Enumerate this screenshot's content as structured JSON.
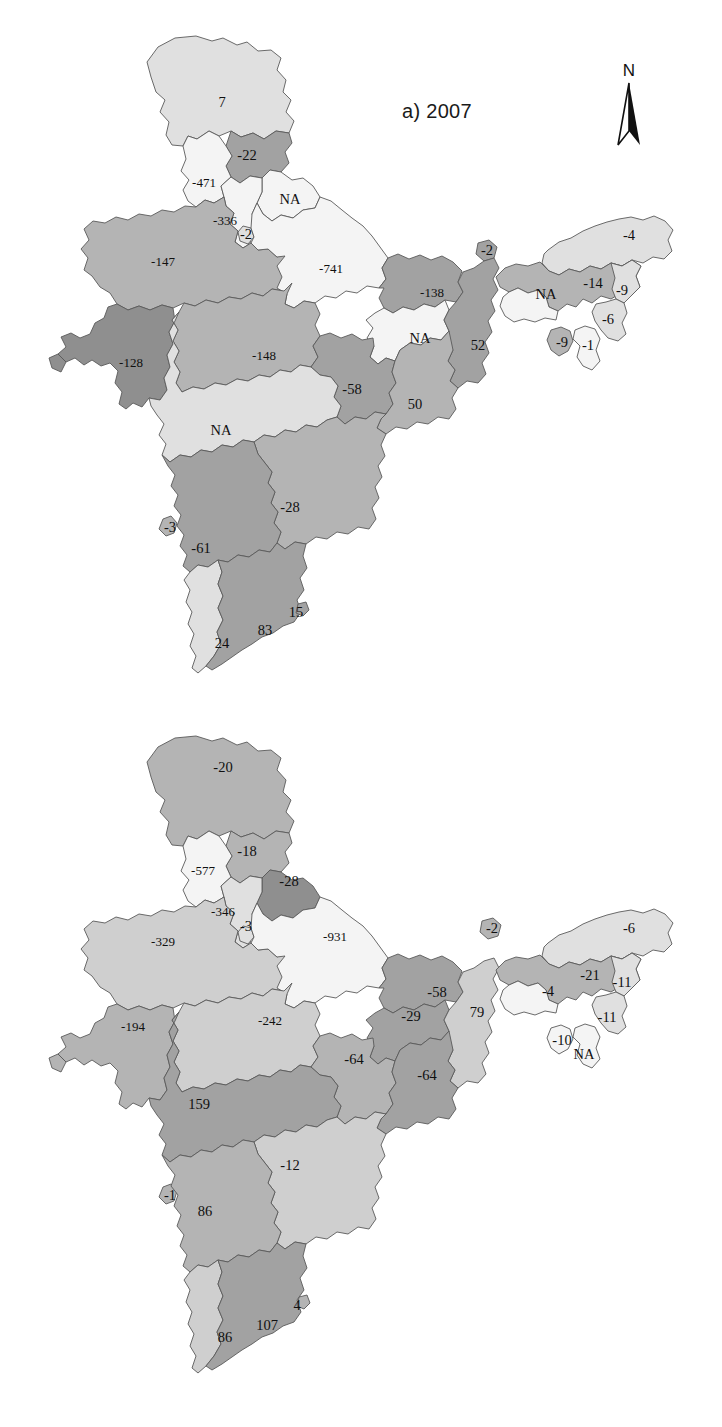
{
  "figure": {
    "kind": "choropleth-map-pair",
    "country": "India",
    "north_arrow": {
      "label": "N",
      "icon": "north-arrow-icon"
    }
  },
  "panels": [
    {
      "id": "a",
      "title": "a) 2007",
      "year": "2007",
      "regions": [
        {
          "name": "jammu-kashmir",
          "label": "7",
          "tone": "light",
          "x": 222,
          "y": 104
        },
        {
          "name": "himachal-pradesh",
          "label": "-22",
          "tone": "mdark",
          "x": 247,
          "y": 157
        },
        {
          "name": "punjab",
          "label": "-471",
          "tone": "vlight",
          "x": 204,
          "y": 184
        },
        {
          "name": "uttarakhand",
          "label": "NA",
          "tone": "vlight",
          "x": 290,
          "y": 201
        },
        {
          "name": "haryana",
          "label": "-336",
          "tone": "vlight",
          "x": 225,
          "y": 222
        },
        {
          "name": "delhi",
          "label": "-2",
          "tone": "light",
          "x": 246,
          "y": 236
        },
        {
          "name": "rajasthan",
          "label": "-147",
          "tone": "mid",
          "x": 163,
          "y": 263
        },
        {
          "name": "uttar-pradesh",
          "label": "-741",
          "tone": "vlight",
          "x": 331,
          "y": 270
        },
        {
          "name": "gujarat",
          "label": "-128",
          "tone": "dark",
          "x": 131,
          "y": 364
        },
        {
          "name": "madhya-pradesh",
          "label": "-148",
          "tone": "mid",
          "x": 264,
          "y": 357
        },
        {
          "name": "bihar",
          "label": "-138",
          "tone": "mdark",
          "x": 432,
          "y": 294
        },
        {
          "name": "sikkim",
          "label": "-2",
          "tone": "mdark",
          "x": 487,
          "y": 252
        },
        {
          "name": "jharkhand",
          "label": "NA",
          "tone": "vlight",
          "x": 420,
          "y": 340
        },
        {
          "name": "west-bengal",
          "label": "52",
          "tone": "mdark",
          "x": 478,
          "y": 347
        },
        {
          "name": "chhattisgarh",
          "label": "-58",
          "tone": "mdark",
          "x": 352,
          "y": 391
        },
        {
          "name": "odisha",
          "label": "50",
          "tone": "mid",
          "x": 415,
          "y": 406
        },
        {
          "name": "maharashtra",
          "label": "NA",
          "tone": "light",
          "x": 221,
          "y": 432
        },
        {
          "name": "goa",
          "label": "-3",
          "tone": "mid",
          "x": 170,
          "y": 529
        },
        {
          "name": "telangana-andhra",
          "label": "-28",
          "tone": "mid",
          "x": 290,
          "y": 509
        },
        {
          "name": "karnataka",
          "label": "-61",
          "tone": "mdark",
          "x": 201,
          "y": 550
        },
        {
          "name": "puducherry",
          "label": "15",
          "tone": "mdark",
          "x": 296,
          "y": 614
        },
        {
          "name": "tamil-nadu",
          "label": "83",
          "tone": "mdark",
          "x": 265,
          "y": 632
        },
        {
          "name": "kerala",
          "label": "24",
          "tone": "light",
          "x": 222,
          "y": 645
        },
        {
          "name": "arunachal-pradesh",
          "label": "-4",
          "tone": "light",
          "x": 629,
          "y": 237
        },
        {
          "name": "assam",
          "label": "-14",
          "tone": "mid",
          "x": 593,
          "y": 285
        },
        {
          "name": "nagaland",
          "label": "-9",
          "tone": "light",
          "x": 622,
          "y": 292
        },
        {
          "name": "meghalaya",
          "label": "NA",
          "tone": "vlight",
          "x": 546,
          "y": 296
        },
        {
          "name": "manipur",
          "label": "-6",
          "tone": "light",
          "x": 608,
          "y": 321
        },
        {
          "name": "tripura",
          "label": "-9",
          "tone": "mid",
          "x": 562,
          "y": 344
        },
        {
          "name": "mizoram",
          "label": "-1",
          "tone": "vlight",
          "x": 588,
          "y": 347
        }
      ]
    },
    {
      "id": "b",
      "title": "b) 2011",
      "year": "2011",
      "regions": [
        {
          "name": "jammu-kashmir",
          "label": "-20",
          "tone": "mid",
          "x": 223,
          "y": 769
        },
        {
          "name": "himachal-pradesh",
          "label": "-18",
          "tone": "mid",
          "x": 247,
          "y": 853
        },
        {
          "name": "punjab",
          "label": "-577",
          "tone": "vlight",
          "x": 203,
          "y": 872
        },
        {
          "name": "uttarakhand",
          "label": "-28",
          "tone": "dark",
          "x": 289,
          "y": 883
        },
        {
          "name": "haryana",
          "label": "-346",
          "tone": "light",
          "x": 223,
          "y": 913
        },
        {
          "name": "delhi",
          "label": "-3",
          "tone": "light",
          "x": 246,
          "y": 928
        },
        {
          "name": "rajasthan",
          "label": "-329",
          "tone": "mlight",
          "x": 163,
          "y": 943
        },
        {
          "name": "uttar-pradesh",
          "label": "-931",
          "tone": "vlight",
          "x": 335,
          "y": 938
        },
        {
          "name": "gujarat",
          "label": "-194",
          "tone": "mid",
          "x": 133,
          "y": 1028
        },
        {
          "name": "madhya-pradesh",
          "label": "-242",
          "tone": "mlight",
          "x": 270,
          "y": 1022
        },
        {
          "name": "sikkim",
          "label": "-2",
          "tone": "mid",
          "x": 492,
          "y": 930
        },
        {
          "name": "bihar",
          "label": "-58",
          "tone": "mdark",
          "x": 437,
          "y": 994
        },
        {
          "name": "jharkhand",
          "label": "-29",
          "tone": "mdark",
          "x": 411,
          "y": 1018
        },
        {
          "name": "west-bengal",
          "label": "79",
          "tone": "mlight",
          "x": 477,
          "y": 1014
        },
        {
          "name": "chhattisgarh",
          "label": "-64",
          "tone": "mid",
          "x": 354,
          "y": 1061
        },
        {
          "name": "odisha",
          "label": "-64",
          "tone": "mdark",
          "x": 427,
          "y": 1077
        },
        {
          "name": "maharashtra",
          "label": "159",
          "tone": "mdark",
          "x": 199,
          "y": 1106
        },
        {
          "name": "telangana-andhra",
          "label": "-12",
          "tone": "mlight",
          "x": 290,
          "y": 1167
        },
        {
          "name": "goa",
          "label": "-1",
          "tone": "mid",
          "x": 170,
          "y": 1197
        },
        {
          "name": "karnataka",
          "label": "86",
          "tone": "mid",
          "x": 205,
          "y": 1213
        },
        {
          "name": "puducherry",
          "label": "4",
          "tone": "mid",
          "x": 297,
          "y": 1307
        },
        {
          "name": "tamil-nadu",
          "label": "107",
          "tone": "mdark",
          "x": 267,
          "y": 1327
        },
        {
          "name": "kerala",
          "label": "86",
          "tone": "mlight",
          "x": 225,
          "y": 1339
        },
        {
          "name": "arunachal-pradesh",
          "label": "-6",
          "tone": "light",
          "x": 629,
          "y": 930
        },
        {
          "name": "assam",
          "label": "-21",
          "tone": "mid",
          "x": 590,
          "y": 977
        },
        {
          "name": "nagaland",
          "label": "-11",
          "tone": "light",
          "x": 622,
          "y": 984
        },
        {
          "name": "meghalaya",
          "label": "-4",
          "tone": "vlight",
          "x": 548,
          "y": 993
        },
        {
          "name": "manipur",
          "label": "-11",
          "tone": "light",
          "x": 607,
          "y": 1019
        },
        {
          "name": "tripura",
          "label": "-10",
          "tone": "vlight",
          "x": 562,
          "y": 1042
        },
        {
          "name": "mizoram",
          "label": "NA",
          "tone": "vlight",
          "x": 584,
          "y": 1056
        }
      ]
    }
  ],
  "chart_data": {
    "type": "map",
    "panels": [
      {
        "label": "a) 2007",
        "categories": [
          "Jammu & Kashmir",
          "Himachal Pradesh",
          "Punjab",
          "Uttarakhand",
          "Haryana",
          "Delhi",
          "Rajasthan",
          "Uttar Pradesh",
          "Gujarat",
          "Madhya Pradesh",
          "Bihar",
          "Sikkim",
          "Jharkhand",
          "West Bengal",
          "Chhattisgarh",
          "Odisha",
          "Maharashtra",
          "Goa",
          "Andhra Pradesh",
          "Karnataka",
          "Puducherry",
          "Tamil Nadu",
          "Kerala",
          "Arunachal Pradesh",
          "Assam",
          "Nagaland",
          "Meghalaya",
          "Manipur",
          "Tripura",
          "Mizoram"
        ],
        "values": [
          7,
          -22,
          -471,
          null,
          -336,
          -2,
          -147,
          -741,
          -128,
          -148,
          -138,
          -2,
          null,
          52,
          -58,
          50,
          null,
          -3,
          -28,
          -61,
          15,
          83,
          24,
          -4,
          -14,
          -9,
          null,
          -6,
          -9,
          -1
        ],
        "value_labels": [
          "7",
          "-22",
          "-471",
          "NA",
          "-336",
          "-2",
          "-147",
          "-741",
          "-128",
          "-148",
          "-138",
          "-2",
          "NA",
          "52",
          "-58",
          "50",
          "NA",
          "-3",
          "-28",
          "-61",
          "15",
          "83",
          "24",
          "-4",
          "-14",
          "-9",
          "NA",
          "-6",
          "-9",
          "-1"
        ]
      },
      {
        "label": "b) 2011",
        "categories": [
          "Jammu & Kashmir",
          "Himachal Pradesh",
          "Punjab",
          "Uttarakhand",
          "Haryana",
          "Delhi",
          "Rajasthan",
          "Uttar Pradesh",
          "Gujarat",
          "Madhya Pradesh",
          "Sikkim",
          "Bihar",
          "Jharkhand",
          "West Bengal",
          "Chhattisgarh",
          "Odisha",
          "Maharashtra",
          "Andhra Pradesh",
          "Goa",
          "Karnataka",
          "Puducherry",
          "Tamil Nadu",
          "Kerala",
          "Arunachal Pradesh",
          "Assam",
          "Nagaland",
          "Meghalaya",
          "Manipur",
          "Tripura",
          "Mizoram"
        ],
        "values": [
          -20,
          -18,
          -577,
          -28,
          -346,
          -3,
          -329,
          -931,
          -194,
          -242,
          -2,
          -58,
          -29,
          79,
          -64,
          -64,
          159,
          -12,
          -1,
          86,
          4,
          107,
          86,
          -6,
          -21,
          -11,
          -4,
          -11,
          -10,
          null
        ],
        "value_labels": [
          "-20",
          "-18",
          "-577",
          "-28",
          "-346",
          "-3",
          "-329",
          "-931",
          "-194",
          "-242",
          "-2",
          "-58",
          "-29",
          "79",
          "-64",
          "-64",
          "159",
          "-12",
          "-1",
          "86",
          "4",
          "107",
          "86",
          "-6",
          "-21",
          "-11",
          "-4",
          "-11",
          "-10",
          "NA"
        ]
      }
    ],
    "legend": null,
    "grid": false
  }
}
